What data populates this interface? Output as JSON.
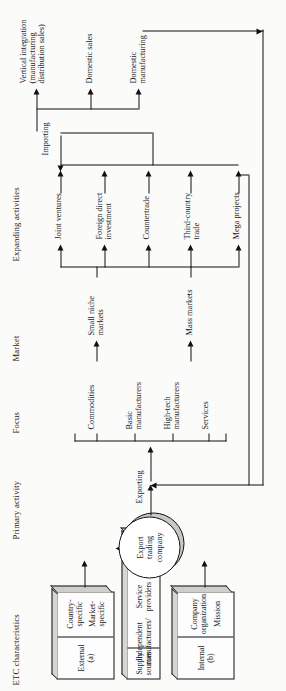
{
  "figure": {
    "orientation": "rotated-90-ccw",
    "line_color": "#111111",
    "box_fill": "#fdfdfd",
    "box_shade": "#d0d0cb"
  },
  "column_headings": [
    {
      "id": "etc",
      "label": "ETC characteristics"
    },
    {
      "id": "primary",
      "label": "Primary activity"
    },
    {
      "id": "focus",
      "label": "Focus"
    },
    {
      "id": "market",
      "label": "Market"
    },
    {
      "id": "expanding",
      "label": "Expanding activities"
    }
  ],
  "etc": {
    "external": {
      "header": "External",
      "header_note": "(a)",
      "items": [
        "Country-\nspecific",
        "Market-\nspecific"
      ]
    },
    "supply": {
      "header": "Supply sources",
      "items": [
        "Independent\nmanufacturers/",
        "Service\nproviders",
        "Parent company",
        "Joint venture"
      ]
    },
    "internal": {
      "header": "Internal",
      "header_note": "(b)",
      "items": [
        "Company\norganization",
        "Mission"
      ]
    }
  },
  "core": {
    "label": "Export\ntrading\ncompany"
  },
  "primary_activity": {
    "label": "Exporting"
  },
  "focus": {
    "items": [
      "Commodities",
      "Basic\nmanufacturers",
      "High-tech\nmanufacturers",
      "Services"
    ]
  },
  "market": {
    "items": [
      "Small niche\nmarkets",
      "Mass markets"
    ]
  },
  "expanding": {
    "items": [
      "Joint ventures",
      "Foreign direct\ninvestment",
      "Countertrade",
      "Third-country\ntrade",
      "Mega projects"
    ]
  },
  "importing": {
    "label": "Importing"
  },
  "outcomes": [
    "Vertical integration\n(manufacturing\ndistribution sales)",
    "Domestic sales",
    "Domestic\nmanufacturing"
  ]
}
